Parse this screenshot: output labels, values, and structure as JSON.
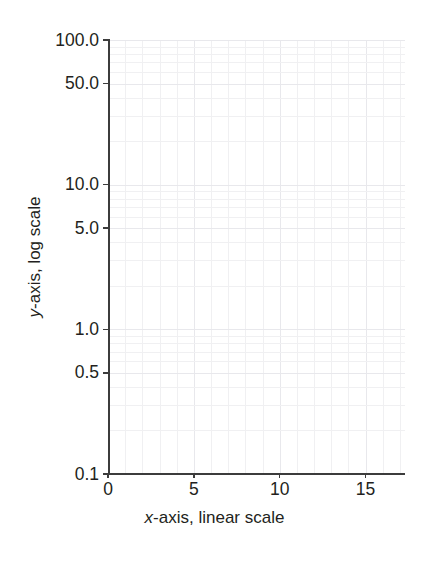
{
  "chart_data": {
    "type": "line",
    "title": "",
    "subtitle": "",
    "xlabel_prefix": "x",
    "xlabel_rest": "-axis, linear scale",
    "ylabel_prefix": "y",
    "ylabel_rest": "-axis, log scale",
    "xlabel": "x-axis, linear scale",
    "ylabel": "y-axis, log scale",
    "x_scale": "linear",
    "y_scale": "log",
    "xlim": [
      0,
      17.3
    ],
    "ylim": [
      0.1,
      100
    ],
    "x_ticks": [
      0,
      5,
      10,
      15
    ],
    "x_tick_labels": [
      "0",
      "5",
      "10",
      "15"
    ],
    "y_ticks": [
      0.1,
      0.5,
      1.0,
      5.0,
      10.0,
      50.0,
      100.0
    ],
    "y_tick_labels": [
      "0.1",
      "0.5",
      "1.0",
      "5.0",
      "10.0",
      "50.0",
      "100.0"
    ],
    "grid": true,
    "grid_color": "#f0f0f2",
    "axis_color": "#3c3c3c",
    "background": "#ffffff",
    "legend": null,
    "series": [],
    "values": [],
    "categories": [],
    "annotations": []
  },
  "axes": {
    "x_ticks": [
      {
        "label": "0",
        "value": 0
      },
      {
        "label": "5",
        "value": 5
      },
      {
        "label": "10",
        "value": 10
      },
      {
        "label": "15",
        "value": 15
      }
    ],
    "y_ticks": [
      {
        "label": "100.0",
        "value": 100
      },
      {
        "label": "50.0",
        "value": 50
      },
      {
        "label": "10.0",
        "value": 10
      },
      {
        "label": "5.0",
        "value": 5
      },
      {
        "label": "1.0",
        "value": 1
      },
      {
        "label": "0.5",
        "value": 0.5
      },
      {
        "label": "0.1",
        "value": 0.1
      }
    ]
  },
  "labels": {
    "x_title_var": "x",
    "x_title_text": "-axis, linear scale",
    "y_title_var": "y",
    "y_title_text": "-axis, log scale"
  }
}
